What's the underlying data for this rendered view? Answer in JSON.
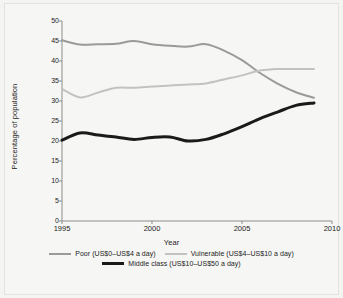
{
  "chart_data": {
    "type": "line",
    "title": "",
    "xlabel": "Year",
    "ylabel": "Percentage of population",
    "xlim": [
      1995,
      2010
    ],
    "ylim": [
      0,
      50
    ],
    "xticks": [
      1995,
      2000,
      2005,
      2010
    ],
    "yticks": [
      0,
      5,
      10,
      15,
      20,
      25,
      30,
      35,
      40,
      45,
      50
    ],
    "grid": false,
    "legend_position": "bottom",
    "x": [
      1995,
      1996,
      1997,
      1998,
      1999,
      2000,
      2001,
      2002,
      2003,
      2004,
      2005,
      2006,
      2007,
      2008,
      2009
    ],
    "series": [
      {
        "name": "Poor (US$0–US$4 a day)",
        "color": "#9a9a9a",
        "width": 2,
        "values": [
          45.2,
          44.1,
          44.2,
          44.3,
          45.0,
          44.2,
          43.8,
          43.6,
          44.2,
          42.6,
          40.2,
          37.0,
          34.3,
          32.2,
          30.8
        ]
      },
      {
        "name": "Vulnerable (US$4–US$10 a day)",
        "color": "#c2c2c2",
        "width": 2,
        "values": [
          33.0,
          30.9,
          32.1,
          33.3,
          33.3,
          33.6,
          33.9,
          34.1,
          34.4,
          35.4,
          36.4,
          37.6,
          38.0,
          38.0,
          38.0
        ]
      },
      {
        "name": "Middle class (US$10–US$50 a day)",
        "color": "#1a1a1a",
        "width": 3,
        "values": [
          20.2,
          22.0,
          21.5,
          21.0,
          20.4,
          20.9,
          21.0,
          20.0,
          20.4,
          21.8,
          23.6,
          25.6,
          27.3,
          28.9,
          29.5
        ]
      }
    ]
  },
  "axes": {
    "ylabel": "Percentage of population",
    "xlabel": "Year",
    "ytick_labels": [
      "50",
      "45",
      "40",
      "35",
      "30",
      "25",
      "20",
      "15",
      "10",
      "5",
      "0"
    ],
    "xtick_labels": [
      "1995",
      "2000",
      "2005",
      "2010"
    ]
  },
  "legend": {
    "row1": [
      {
        "label": "Poor (US$0–US$4 a day)",
        "swatch": "poor-line-swatch"
      },
      {
        "label": "Vulnerable (US$4–US$10 a day)",
        "swatch": "vulnerable-line-swatch"
      }
    ],
    "row2": [
      {
        "label": "Middle class (US$10–US$50 a day)",
        "swatch": "middle-class-line-swatch"
      }
    ]
  }
}
